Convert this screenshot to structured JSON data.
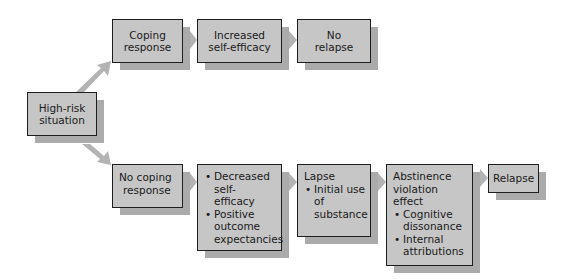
{
  "diagram": {
    "nodes": {
      "high_risk": {
        "lines": [
          "High-risk",
          "situation"
        ]
      },
      "coping": {
        "lines": [
          "Coping",
          "response"
        ]
      },
      "increased": {
        "lines": [
          "Increased",
          "self-efficacy"
        ]
      },
      "no_relapse": {
        "lines": [
          "No",
          "relapse"
        ]
      },
      "no_coping": {
        "lines": [
          "No coping",
          "response"
        ]
      },
      "decreased": {
        "bullets": [
          "Decreased self-efficacy",
          "Positive outcome expectancies"
        ]
      },
      "lapse": {
        "title": "Lapse",
        "bullets": [
          "Initial use of substance"
        ]
      },
      "abstinence": {
        "title": "Abstinence violation effect",
        "bullets": [
          "Cognitive dissonance",
          "Internal attributions"
        ]
      },
      "relapse": {
        "lines": [
          "Relapse"
        ]
      }
    },
    "edges": [
      {
        "from": "high_risk",
        "to": "coping"
      },
      {
        "from": "high_risk",
        "to": "no_coping"
      },
      {
        "from": "coping",
        "to": "increased"
      },
      {
        "from": "increased",
        "to": "no_relapse"
      },
      {
        "from": "no_coping",
        "to": "decreased"
      },
      {
        "from": "decreased",
        "to": "lapse"
      },
      {
        "from": "lapse",
        "to": "abstinence"
      },
      {
        "from": "abstinence",
        "to": "relapse"
      }
    ],
    "colors": {
      "box_fill": "#c6c6c6",
      "shadow": "#ababab",
      "arrow": "#b0b0b0",
      "border": "#1e1e1e"
    }
  }
}
